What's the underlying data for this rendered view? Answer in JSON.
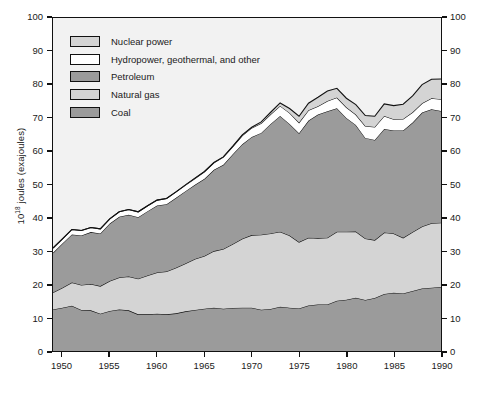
{
  "chart_data": {
    "type": "area",
    "stacked": true,
    "title": "",
    "subtitle": "",
    "xlabel": "",
    "ylabel": "10^18 joules (exajoules)",
    "ylabel_rich": "10¹⁸ joules (exajoules)",
    "xlim": [
      1949,
      1990
    ],
    "ylim": [
      0,
      100
    ],
    "ytick_values": [
      0,
      10,
      20,
      30,
      40,
      50,
      60,
      70,
      80,
      90,
      100
    ],
    "ytick_labels": [
      "0",
      "10",
      "20",
      "30",
      "40",
      "50",
      "60",
      "70",
      "80",
      "90",
      "100"
    ],
    "xtick_values": [
      1950,
      1955,
      1960,
      1965,
      1970,
      1975,
      1980,
      1985,
      1990
    ],
    "xtick_labels": [
      "1950",
      "1955",
      "1960",
      "1965",
      "1970",
      "1975",
      "1980",
      "1985",
      "1990"
    ],
    "y_axis_both_sides": true,
    "grid": false,
    "legend_position": "upper-left-inside",
    "x": [
      1949,
      1950,
      1951,
      1952,
      1953,
      1954,
      1955,
      1956,
      1957,
      1958,
      1959,
      1960,
      1961,
      1962,
      1963,
      1964,
      1965,
      1966,
      1967,
      1968,
      1969,
      1970,
      1971,
      1972,
      1973,
      1974,
      1975,
      1976,
      1977,
      1978,
      1979,
      1980,
      1981,
      1982,
      1983,
      1984,
      1985,
      1986,
      1987,
      1988,
      1989,
      1990
    ],
    "series": [
      {
        "name": "Coal",
        "color": "#9b9b9b",
        "stack_order": 1,
        "values": [
          12.5,
          13.0,
          13.6,
          12.3,
          12.2,
          11.2,
          12.0,
          12.5,
          12.2,
          11.0,
          11.0,
          11.2,
          11.0,
          11.3,
          11.9,
          12.3,
          12.7,
          13.0,
          12.7,
          12.9,
          13.0,
          13.0,
          12.4,
          12.6,
          13.3,
          13.0,
          12.8,
          13.7,
          14.0,
          14.0,
          15.1,
          15.4,
          16.0,
          15.3,
          15.9,
          17.1,
          17.5,
          17.3,
          18.0,
          18.8,
          19.0,
          19.2
        ]
      },
      {
        "name": "Natural gas",
        "color": "#d4d4d4",
        "stack_order": 2,
        "values": [
          5.1,
          6.0,
          7.0,
          7.5,
          7.9,
          8.3,
          9.0,
          9.6,
          10.2,
          10.7,
          11.7,
          12.4,
          12.9,
          13.7,
          14.4,
          15.3,
          15.8,
          17.0,
          17.9,
          19.2,
          20.7,
          21.8,
          22.5,
          22.7,
          22.5,
          21.7,
          19.9,
          20.3,
          19.9,
          20.0,
          20.7,
          20.4,
          19.9,
          18.5,
          17.4,
          18.5,
          17.8,
          16.7,
          17.7,
          18.6,
          19.4,
          19.3
        ]
      },
      {
        "name": "Petroleum",
        "color": "#9b9b9b",
        "stack_order": 3,
        "values": [
          11.9,
          13.3,
          14.4,
          14.9,
          15.6,
          15.8,
          17.3,
          18.2,
          18.5,
          18.5,
          19.3,
          20.1,
          20.2,
          21.0,
          21.7,
          22.3,
          23.2,
          24.4,
          25.3,
          27.0,
          28.4,
          29.5,
          30.6,
          32.9,
          34.8,
          33.5,
          32.7,
          35.2,
          37.1,
          38.0,
          37.1,
          34.2,
          32.0,
          30.2,
          30.1,
          31.1,
          30.9,
          32.2,
          32.9,
          34.2,
          34.2,
          33.6
        ]
      },
      {
        "name": "Hydropower, geothermal, and other",
        "color": "#ffffff",
        "stack_order": 4,
        "values": [
          1.4,
          1.4,
          1.5,
          1.5,
          1.4,
          1.4,
          1.4,
          1.5,
          1.6,
          1.6,
          1.6,
          1.6,
          1.7,
          1.8,
          1.8,
          1.9,
          2.1,
          2.1,
          2.3,
          2.3,
          2.6,
          2.7,
          2.9,
          2.9,
          3.0,
          3.3,
          3.2,
          3.1,
          2.5,
          3.1,
          3.2,
          3.2,
          3.1,
          3.6,
          3.9,
          3.9,
          3.4,
          3.5,
          3.1,
          2.8,
          3.3,
          3.5
        ]
      },
      {
        "name": "Nuclear power",
        "color": "#d4d4d4",
        "stack_order": 5,
        "values": [
          0.0,
          0.0,
          0.0,
          0.0,
          0.0,
          0.0,
          0.0,
          0.0,
          0.0,
          0.0,
          0.0,
          0.0,
          0.0,
          0.0,
          0.1,
          0.1,
          0.1,
          0.1,
          0.1,
          0.1,
          0.2,
          0.2,
          0.4,
          0.6,
          0.9,
          1.3,
          1.9,
          2.1,
          2.7,
          3.0,
          2.8,
          2.7,
          3.0,
          3.1,
          3.2,
          3.6,
          4.1,
          4.4,
          4.9,
          5.6,
          5.7,
          6.1
        ]
      }
    ],
    "totals_note": "stack top equals sum of all five series",
    "annotations": []
  },
  "legend": {
    "items": [
      {
        "label": "Nuclear power",
        "color": "#d4d4d4"
      },
      {
        "label": "Hydropower, geothermal, and other",
        "color": "#ffffff"
      },
      {
        "label": "Petroleum",
        "color": "#9b9b9b"
      },
      {
        "label": "Natural gas",
        "color": "#d4d4d4"
      },
      {
        "label": "Coal",
        "color": "#9b9b9b"
      }
    ]
  },
  "style": {
    "axis_color": "#111111",
    "plot_background": "#f2f2f2",
    "figure_background": "#ffffff",
    "line_color": "#111111"
  }
}
